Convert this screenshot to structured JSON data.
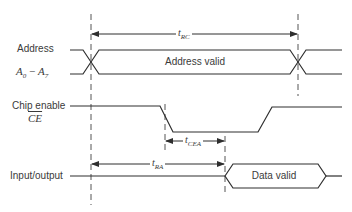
{
  "diagram": {
    "type": "timing-diagram",
    "signals": [
      {
        "name": "address",
        "label": "Address",
        "sublabel": {
          "base": "A",
          "sub0": "0",
          "dash": " − ",
          "base2": "A",
          "sub1": "7"
        },
        "state_label": "Address valid"
      },
      {
        "name": "chip-enable",
        "label": "Chip enable",
        "sublabel": "CE",
        "sublabel_overline": true
      },
      {
        "name": "input-output",
        "label": "Input/output",
        "state_label": "Data valid"
      }
    ],
    "timings": [
      {
        "name": "t-rc",
        "base": "t",
        "sub": "RC",
        "from": "address-change-start",
        "to": "address-change-end"
      },
      {
        "name": "t-cea",
        "base": "t",
        "sub": "CEA",
        "from": "ce-fall-start",
        "to": "data-valid"
      },
      {
        "name": "t-ra",
        "base": "t",
        "sub": "RA",
        "from": "address-change-start",
        "to": "data-valid"
      }
    ]
  },
  "colors": {
    "line": "#2e2e2e",
    "dashed": "#555555",
    "text": "#3a3a3a",
    "background": "#ffffff"
  }
}
